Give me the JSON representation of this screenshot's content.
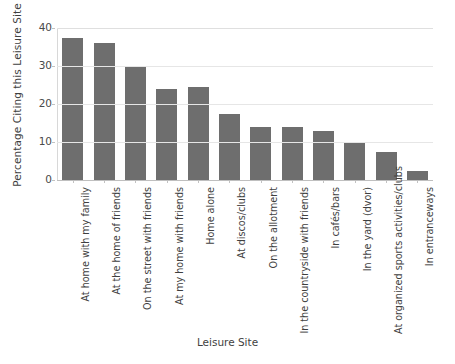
{
  "chart_data": {
    "type": "bar",
    "title": "",
    "xlabel": "Leisure Site",
    "ylabel": "Percentage Citing this Leisure Site",
    "ylim": [
      0,
      40
    ],
    "yticks": [
      0,
      10,
      20,
      30,
      40
    ],
    "ytick_labels": [
      "0",
      "10",
      "20",
      "30",
      "40"
    ],
    "grid": true,
    "legend": "none",
    "bar_color": "#6e6e6e",
    "categories": [
      "At home with my family",
      "At the home of friends",
      "On the street with friends",
      "At my home with friends",
      "Home alone",
      "At discos/clubs",
      "On the allotment",
      "In the countryside with friends",
      "In cafés/bars",
      "In the yard (dvor)",
      "At organized sports activities/clubs",
      "In entranceways"
    ],
    "values": [
      37.5,
      36,
      30,
      24,
      24.5,
      17.5,
      14,
      14,
      13,
      10,
      7.5,
      2.5
    ]
  },
  "axes": {
    "y_title": "Percentage Citing this Leisure Site",
    "x_title": "Leisure Site"
  }
}
